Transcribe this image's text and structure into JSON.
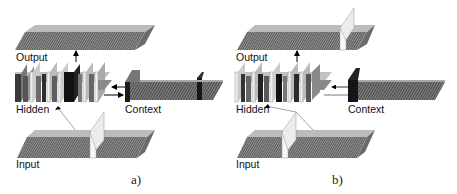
{
  "figure": {
    "panels": [
      {
        "id": "a",
        "caption": "a)",
        "labels": {
          "output": "Output",
          "hidden": "Hidden",
          "context": "Context",
          "input": "Input"
        }
      },
      {
        "id": "b",
        "caption": "b)",
        "labels": {
          "output": "Output",
          "hidden": "Hidden",
          "context": "Context",
          "input": "Input"
        }
      }
    ],
    "colors": {
      "sheet_dark": "#4a4a4a",
      "sheet_mid": "#7a7a7a",
      "sheet_light": "#bdbdbd",
      "sheet_white": "#f2f2f2",
      "black": "#111111",
      "arrow": "#000000",
      "connection_line": "#8a8a8a"
    }
  }
}
